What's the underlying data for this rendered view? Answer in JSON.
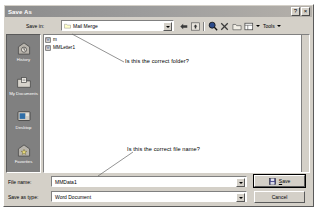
{
  "dialog": {
    "title": "Save As",
    "titlebar_buttons": [
      {
        "name": "help-button",
        "glyph": "?"
      },
      {
        "name": "close-button",
        "glyph": "×"
      }
    ]
  },
  "savein": {
    "label": "Save in:",
    "value": "Mail Merge",
    "icon": "folder-icon"
  },
  "toolbar": {
    "items": [
      {
        "name": "back-button",
        "icon": "back-arrow-icon",
        "label": ""
      },
      {
        "name": "up-one-level-button",
        "icon": "up-folder-icon",
        "label": ""
      },
      {
        "name": "search-web-button",
        "icon": "search-icon",
        "label": ""
      },
      {
        "name": "delete-button",
        "icon": "delete-x-icon",
        "label": ""
      },
      {
        "name": "new-folder-button",
        "icon": "new-folder-icon",
        "label": ""
      },
      {
        "name": "views-button",
        "icon": "views-icon",
        "label": ""
      }
    ],
    "tools_label": "Tools",
    "tools_dropdown": "chevron-down-icon"
  },
  "places": {
    "items": [
      {
        "label": "History",
        "icon": "history-icon"
      },
      {
        "label": "My Documents",
        "icon": "my-documents-icon"
      },
      {
        "label": "Desktop",
        "icon": "desktop-icon"
      },
      {
        "label": "Favorites",
        "icon": "favorites-icon"
      }
    ]
  },
  "filelist": {
    "files": [
      {
        "name": "m",
        "icon": "word-document-icon"
      },
      {
        "name": "MMLetter1",
        "icon": "word-document-icon"
      }
    ]
  },
  "annotations": [
    {
      "text": "Is this the correct folder?",
      "name": "annotation-folder"
    },
    {
      "text": "Is this the correct file name?",
      "name": "annotation-filename"
    }
  ],
  "fields": {
    "filename_label": "File name:",
    "filename_value": "MMData1",
    "filetype_label": "Save as type:",
    "filetype_value": "Word Document"
  },
  "buttons": {
    "save_label": "Save",
    "save_accel": "S",
    "cancel_label": "Cancel"
  },
  "colors": {
    "dialog_face": "#d4d0c8",
    "titlebar": "#8c8c8c",
    "places_bar": "#808080",
    "field_bg": "#ffffff"
  }
}
